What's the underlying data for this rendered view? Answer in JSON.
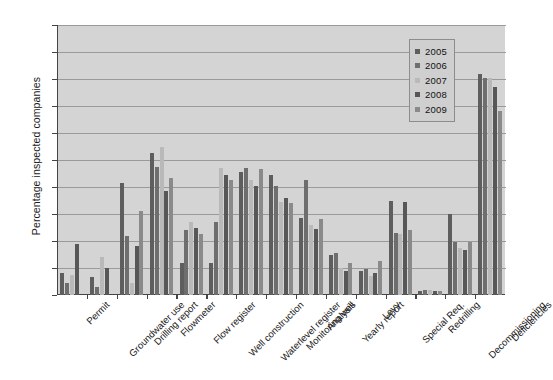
{
  "chart_data": {
    "type": "bar",
    "title": "",
    "xlabel": "",
    "ylabel": "Percentage inspected companies",
    "ylim": [
      0,
      100
    ],
    "yticks": [
      0,
      10,
      20,
      30,
      40,
      50,
      60,
      70,
      80,
      90,
      100
    ],
    "grid": true,
    "legend_position": "top-right",
    "categories": [
      "Permit",
      "Groundwater use",
      "Drilling report",
      "Flowmeter",
      "Flow register",
      "Well construction",
      "Waterlevel register",
      "Monitoring well",
      "Analysis",
      "Yearly report",
      "Levy",
      "Special Req.",
      "Redrilling",
      "Decommissioning",
      "Deficiencies"
    ],
    "series": [
      {
        "name": "2005",
        "color": "#5e5e5e",
        "values": [
          8,
          4.5,
          7.5,
          0,
          0,
          0,
          0,
          0,
          0,
          0,
          0,
          0,
          0,
          0,
          0
        ]
      },
      {
        "name": "2006",
        "color": "#6e6e6e",
        "values": [
          0,
          19,
          6.5,
          3,
          14,
          10,
          0,
          0,
          0,
          0,
          0,
          0,
          0,
          0,
          0
        ]
      },
      {
        "name": "2007",
        "color": "#b9b9b9",
        "values": [
          41.5,
          22,
          4.5,
          18,
          31,
          52.5,
          47.5,
          0,
          0,
          0,
          0,
          0,
          0,
          0,
          0
        ]
      },
      {
        "name": "2008",
        "color": "#575757",
        "values": [
          55,
          38.5,
          43.5,
          12,
          24,
          27,
          47,
          35,
          0,
          0,
          0,
          0,
          0,
          0,
          0
        ]
      },
      {
        "name": "2009",
        "color": "#8a8a8a",
        "values": [
          47.5,
          47.5,
          40,
          47.5,
          45.5,
          43,
          41,
          45,
          41,
          0,
          0,
          0,
          0,
          0,
          0
        ]
      }
    ],
    "groups": [
      {
        "category": "Permit",
        "values": [
          8,
          4.5,
          7.5,
          19,
          0
        ]
      },
      {
        "category": "Groundwater use",
        "values": [
          6.5,
          3,
          14,
          10,
          0
        ]
      },
      {
        "category": "Drilling report",
        "values": [
          41.5,
          22,
          4.5,
          18,
          31
        ]
      },
      {
        "category": "Flowmeter",
        "values": [
          52.5,
          47.5,
          55,
          38.5,
          43.5
        ]
      },
      {
        "category": "Flow register",
        "values": [
          12,
          24,
          27,
          25,
          22.5
        ]
      },
      {
        "category": "Well construction",
        "values": [
          12,
          27,
          47,
          44.5,
          42.5
        ]
      },
      {
        "category": "Waterlevel register",
        "values": [
          45.5,
          47,
          42.5,
          40.5,
          46.5
        ]
      },
      {
        "category": "Monitoring well",
        "values": [
          44.5,
          40.5,
          34.5,
          36,
          34
        ]
      },
      {
        "category": "Analysis",
        "values": [
          28.5,
          42.5,
          26,
          24.5,
          28
        ]
      },
      {
        "category": "Yearly report",
        "values": [
          15,
          15.5,
          10,
          9,
          12
        ]
      },
      {
        "category": "Levy",
        "values": [
          9,
          9.5,
          7,
          8,
          12.5
        ]
      },
      {
        "category": "Special Req.",
        "values": [
          35,
          23,
          22.5,
          34.5,
          24
        ]
      },
      {
        "category": "Redrilling",
        "values": [
          1.5,
          2,
          2,
          1.5,
          1.5
        ]
      },
      {
        "category": "Decommissioning",
        "values": [
          30,
          19.5,
          17.5,
          16.5,
          19.5
        ]
      },
      {
        "category": "Deficiencies",
        "values": [
          82,
          80.5,
          80.5,
          77,
          68
        ]
      }
    ]
  },
  "legend": {
    "items": [
      {
        "label": "2005",
        "color": "#5e5e5e"
      },
      {
        "label": "2006",
        "color": "#6e6e6e"
      },
      {
        "label": "2007",
        "color": "#b9b9b9"
      },
      {
        "label": "2008",
        "color": "#575757"
      },
      {
        "label": "2009",
        "color": "#8a8a8a"
      }
    ]
  }
}
